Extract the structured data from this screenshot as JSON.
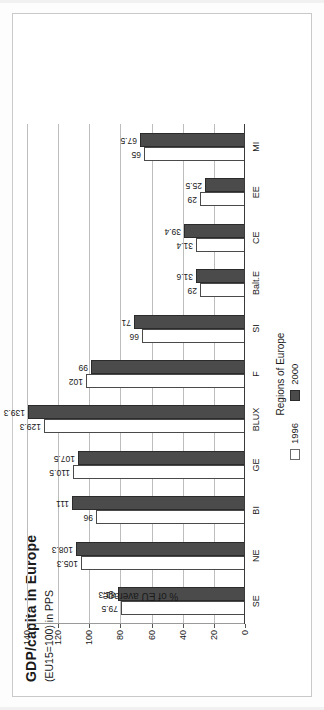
{
  "chart_data": {
    "type": "bar",
    "title": "GDP/capita in Europe",
    "subtitle": "(EU15=100) in PPS",
    "xlabel": "Regions of Europe",
    "ylabel": "% of EU average",
    "ylim": [
      0,
      140
    ],
    "yticks": [
      0,
      20,
      40,
      60,
      80,
      100,
      120,
      140
    ],
    "ytick_labels": [
      "0",
      "20",
      "40",
      "60",
      "80",
      "100",
      "120",
      "140"
    ],
    "grid": true,
    "legend_position": "bottom-right",
    "orientation": "rotated-90-ccw",
    "categories": [
      "SE",
      "NE",
      "BI",
      "GE",
      "BLUX",
      "F",
      "SI",
      "Balt.E",
      "CE",
      "EE",
      "MI"
    ],
    "series": [
      {
        "name": "1996",
        "color": "#ffffff",
        "values": [
          79.5,
          105.3,
          96,
          110.5,
          129.3,
          102,
          66,
          29,
          31.4,
          29,
          65
        ],
        "labels": [
          "79.5",
          "105.3",
          "96",
          "110.5",
          "129.3",
          "102",
          "66",
          "29",
          "31.4",
          "29",
          "65"
        ]
      },
      {
        "name": "2000",
        "color": "#4b4b4b",
        "values": [
          81.3,
          108.3,
          111,
          107.5,
          139.3,
          99,
          71,
          31.6,
          39.4,
          25.5,
          67.5
        ],
        "labels": [
          "81.3",
          "108.3",
          "111",
          "107.5",
          "139.3",
          "99",
          "71",
          "31.6",
          "39.4",
          "25.5",
          "67.5"
        ]
      }
    ]
  },
  "legend": {
    "items": [
      {
        "label": "1996"
      },
      {
        "label": "2000"
      }
    ]
  }
}
